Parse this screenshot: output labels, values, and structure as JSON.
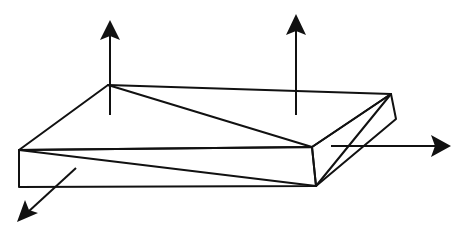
{
  "diagram": {
    "title": "",
    "colors": {
      "stroke": "#111111",
      "background": "#ffffff"
    },
    "vertices": {
      "top_back_left": [
        108,
        85
      ],
      "top_back_right": [
        391,
        94
      ],
      "top_front_left": [
        19,
        150
      ],
      "top_front_right": [
        312,
        147
      ],
      "bottom_front_left": [
        19,
        187
      ],
      "bottom_front_right": [
        316,
        186
      ],
      "bottom_back_right": [
        396,
        119
      ]
    },
    "arrows": [
      {
        "name": "up-arrow-left",
        "direction": "up",
        "from": [
          110,
          115
        ],
        "to": [
          110,
          20
        ]
      },
      {
        "name": "up-arrow-right",
        "direction": "up",
        "from": [
          296,
          115
        ],
        "to": [
          296,
          14
        ]
      },
      {
        "name": "right-arrow",
        "direction": "right",
        "from": [
          331,
          146
        ],
        "to": [
          451,
          146
        ]
      },
      {
        "name": "down-left-arrow",
        "direction": "down-left",
        "from": [
          76,
          168
        ],
        "to": [
          17,
          222
        ]
      }
    ],
    "labels": []
  }
}
